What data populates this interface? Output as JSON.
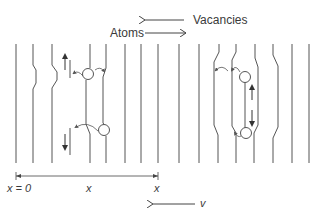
{
  "labels": {
    "vacancies": "Vacancies",
    "atoms": "Atoms",
    "x_zero": "x = 0",
    "x_mid": "x",
    "x_end": "x",
    "velocity": "v"
  },
  "arrows": {
    "vacancies_direction": "left",
    "atoms_direction": "right",
    "velocity_direction": "left"
  },
  "colors": {
    "line": "#555555",
    "text": "#3a3a3a"
  }
}
